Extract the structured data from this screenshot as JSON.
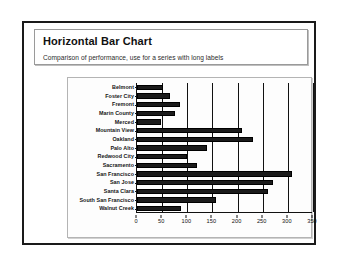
{
  "slide": {
    "title": "Horizontal Bar Chart",
    "subtitle": "Comparison of performance, use for a series with long labels"
  },
  "chart_data": {
    "type": "bar",
    "orientation": "horizontal",
    "title": "Horizontal Bar Chart",
    "subtitle": "Comparison of performance, use for a series with long labels",
    "xlabel": "",
    "ylabel": "",
    "xlim": [
      0,
      350
    ],
    "xticks": [
      0,
      50,
      100,
      150,
      200,
      250,
      300,
      350
    ],
    "xticklabels": [
      "0",
      "50",
      "100",
      "150",
      "200",
      "250",
      "300",
      "350"
    ],
    "grid": true,
    "grid_axis": "x",
    "legend": false,
    "bar_color": "#1b1b1b",
    "categories": [
      "Belmont",
      "Foster City",
      "Fremont",
      "Marin County",
      "Merced",
      "Mountain View",
      "Oakland",
      "Palo Alto",
      "Redwood City",
      "Sacramento",
      "San Francisco",
      "San Jose",
      "Santa Clara",
      "South San Francisco",
      "Walnut Creek"
    ],
    "values": [
      52,
      65,
      85,
      75,
      48,
      208,
      230,
      140,
      100,
      120,
      308,
      270,
      260,
      158,
      88
    ]
  }
}
